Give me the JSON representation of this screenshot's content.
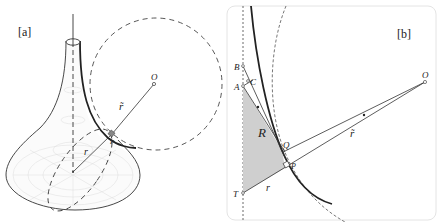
{
  "panel_a": {
    "label": "[a]",
    "point_O": "O",
    "r_tilde": "r̃",
    "r": "r",
    "P": "P"
  },
  "panel_b": {
    "label": "[b]",
    "B": "B",
    "C": "C",
    "A": "A",
    "R": "R",
    "Q": "Q",
    "P": "P",
    "T": "T",
    "r": "r",
    "O": "O",
    "r_tilde": "r̃"
  },
  "colors": {
    "line": "#2a2a2a",
    "shade": "#cfcfcf",
    "frame": "#e6e6e6",
    "mesh": "#d8d8d8"
  }
}
